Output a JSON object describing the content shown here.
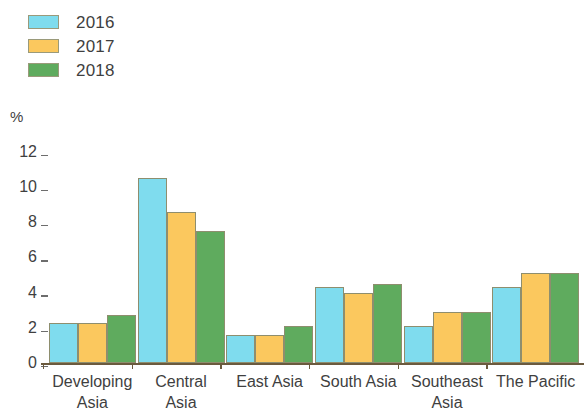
{
  "chart_data": {
    "type": "bar",
    "title": "",
    "subtitle": "",
    "xlabel": "",
    "ylabel": "%",
    "unit_label": "%",
    "ylim": [
      0,
      12
    ],
    "yticks": [
      0,
      2,
      4,
      6,
      8,
      10,
      12
    ],
    "ytick_labels": [
      "0",
      "2",
      "4",
      "6",
      "8",
      "10",
      "12"
    ],
    "grid": false,
    "legend_position": "top-left",
    "categories": [
      "Developing Asia",
      "Central Asia",
      "East Asia",
      "South Asia",
      "Southeast Asia",
      "The Pacific"
    ],
    "category_lines": [
      [
        "Developing",
        "Asia"
      ],
      [
        "Central",
        "Asia"
      ],
      [
        "East Asia"
      ],
      [
        "South Asia"
      ],
      [
        "Southeast",
        "Asia"
      ],
      [
        "The Pacific"
      ]
    ],
    "series": [
      {
        "name": "2016",
        "color": "#7fdcee",
        "values": [
          2.3,
          10.5,
          1.6,
          4.3,
          2.1,
          4.3
        ]
      },
      {
        "name": "2017",
        "color": "#fbc85e",
        "values": [
          2.3,
          8.6,
          1.6,
          4.0,
          2.9,
          5.1
        ]
      },
      {
        "name": "2018",
        "color": "#5fab5e",
        "values": [
          2.7,
          7.5,
          2.1,
          4.5,
          2.9,
          5.1
        ]
      }
    ]
  },
  "legend": {
    "items": [
      {
        "label": "2016",
        "color": "#7fdcee"
      },
      {
        "label": "2017",
        "color": "#fbc85e"
      },
      {
        "label": "2018",
        "color": "#5fab5e"
      }
    ]
  },
  "axis": {
    "unit": "%",
    "ticks": [
      "12",
      "10",
      "8",
      "6",
      "4",
      "2",
      "0"
    ]
  }
}
